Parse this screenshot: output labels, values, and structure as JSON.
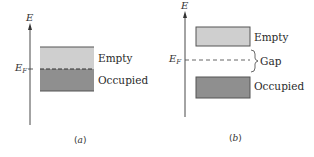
{
  "figure": {
    "panels": [
      {
        "id": "a",
        "caption": "a",
        "axis_label": "E",
        "fermi_label": "E",
        "fermi_subscript": "F",
        "bands": [
          {
            "label": "Empty",
            "fill": "#cfcfcf",
            "edge": "#555555"
          },
          {
            "label": "Occupied",
            "fill": "#8f8f8f",
            "edge": "#555555"
          }
        ],
        "description": "Metal: Fermi level lies within a partially filled band"
      },
      {
        "id": "b",
        "caption": "b",
        "axis_label": "E",
        "fermi_label": "E",
        "fermi_subscript": "F",
        "bands": [
          {
            "label": "Empty",
            "fill": "#cfcfcf",
            "edge": "#555555"
          },
          {
            "label": "Occupied",
            "fill": "#8f8f8f",
            "edge": "#555555"
          }
        ],
        "gap_label": "Gap",
        "description": "Insulator: Fermi level lies in the gap between filled and empty bands"
      }
    ],
    "colors": {
      "empty_band": "#cfcfcf",
      "occupied_band": "#8f8f8f",
      "band_edge": "#555555",
      "axis": "#333333",
      "fermi_dash": "#444444"
    }
  }
}
